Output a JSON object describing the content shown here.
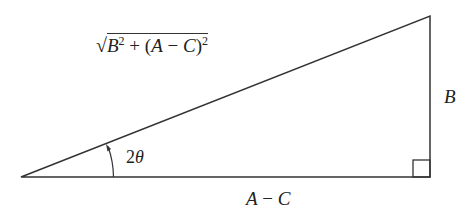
{
  "diagram": {
    "type": "right-triangle",
    "vertices": {
      "left": [
        21,
        177
      ],
      "right_angle": [
        430,
        177
      ],
      "top": [
        430,
        16
      ]
    },
    "right_angle_marker_size": 17,
    "line_color": "#333333",
    "labels": {
      "hypotenuse": {
        "radical": "√",
        "b_var": "B",
        "b_exp": "2",
        "middle": " + (",
        "a_var": "A",
        "minus": " − ",
        "c_var": "C",
        "close": ")",
        "ac_exp": "2"
      },
      "angle": {
        "coef": "2",
        "symbol": "θ"
      },
      "vertical_side": "B",
      "base": {
        "a_var": "A",
        "minus": " − ",
        "c_var": "C"
      }
    }
  }
}
